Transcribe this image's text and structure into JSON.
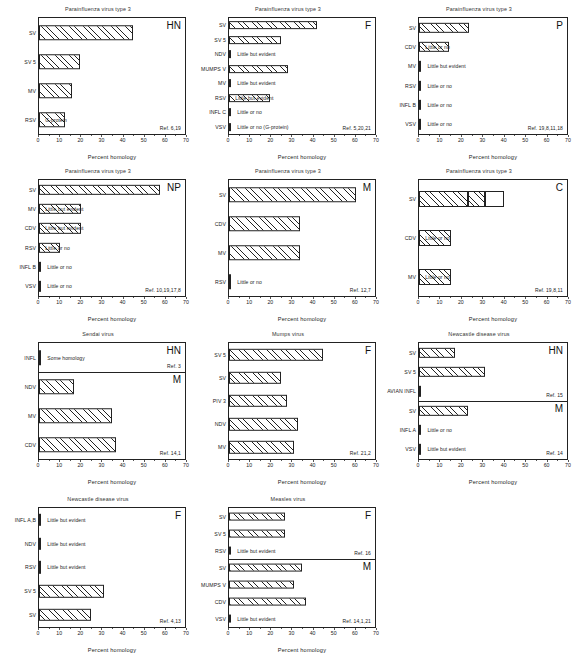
{
  "figure": {
    "axis": {
      "label": "Percent homology",
      "ticks": [
        0,
        10,
        20,
        30,
        40,
        50,
        60,
        70
      ],
      "min": 0,
      "max": 70
    },
    "notes": {
      "little_but_evident": "Little but evident",
      "little_or_no": "Little or no",
      "some_homology": "Some homology"
    }
  },
  "chart_data": [
    {
      "id": "piv3-hn",
      "type": "bar",
      "title": "Parainfluenza virus type 3",
      "gene": "HN",
      "ref": "Ref. 6,19",
      "xlabel": "Percent homology",
      "ylabel": "",
      "xlim": [
        0,
        70
      ],
      "categories": [
        "SV",
        "SV 5",
        "MV",
        "RSV"
      ],
      "values": [
        45,
        19.5,
        16,
        12.5
      ],
      "annotations": [
        "",
        "",
        "",
        "G-protein"
      ]
    },
    {
      "id": "piv3-f",
      "type": "bar",
      "title": "Parainfluenza virus type 3",
      "gene": "F",
      "ref": "Ref. 5,20,21",
      "xlabel": "Percent homology",
      "ylabel": "",
      "xlim": [
        0,
        70
      ],
      "categories": [
        "SV",
        "SV 5",
        "NDV",
        "MUMPS V",
        "MV",
        "RSV",
        "INFL C",
        "VSV"
      ],
      "values": [
        42,
        25,
        0,
        28.5,
        0,
        19.5,
        0,
        0
      ],
      "annotations": [
        "",
        "",
        "Little but evident",
        "",
        "Little but evident",
        "Little but evident",
        "Little or no",
        "Little or no  (G-protein)"
      ]
    },
    {
      "id": "piv3-p",
      "type": "bar",
      "title": "Parainfluenza virus type 3",
      "gene": "P",
      "ref": "Ref. 19,8,11,18",
      "xlabel": "Percent homology",
      "ylabel": "",
      "xlim": [
        0,
        70
      ],
      "categories": [
        "SV",
        "CDV",
        "MV",
        "RSV",
        "INFL B",
        "VSV"
      ],
      "values": [
        23.5,
        14,
        0,
        0,
        0,
        0
      ],
      "annotations": [
        "",
        "Little or no",
        "Little but evident",
        "Little or no",
        "Little or no",
        "Little or no"
      ]
    },
    {
      "id": "piv3-np",
      "type": "bar",
      "title": "Parainfluenza virus type 3",
      "gene": "NP",
      "ref": "Ref. 10,19,17,8",
      "xlabel": "Percent homology",
      "ylabel": "",
      "xlim": [
        0,
        70
      ],
      "categories": [
        "SV",
        "MV",
        "CDV",
        "RSV",
        "INFL B",
        "VSV"
      ],
      "values": [
        58,
        20,
        20,
        10,
        0,
        0
      ],
      "annotations": [
        "",
        "Little but evident",
        "Little but evident",
        "Little or no",
        "Little or no",
        "Little or no"
      ]
    },
    {
      "id": "piv3-m",
      "type": "bar",
      "title": "Parainfluenza virus type 3",
      "gene": "M",
      "ref": "Ref. 12,7",
      "xlabel": "Percent homology",
      "ylabel": "",
      "xlim": [
        0,
        70
      ],
      "categories": [
        "SV",
        "CDV",
        "MV",
        "RSV"
      ],
      "values": [
        61,
        34,
        34,
        0
      ],
      "annotations": [
        "",
        "",
        "",
        "Little or no"
      ]
    },
    {
      "id": "piv3-c",
      "type": "bar",
      "title": "Parainfluenza virus type 3",
      "gene": "C",
      "ref": "Ref. 19,8,11",
      "xlabel": "Percent homology",
      "ylabel": "",
      "xlim": [
        0,
        70
      ],
      "categories": [
        "SV",
        "CDV",
        "MV"
      ],
      "values": [
        31,
        15,
        15
      ],
      "segments": [
        [
          23,
          31,
          40
        ],
        [],
        []
      ],
      "annotations": [
        "",
        "Little or no",
        "Little or no"
      ]
    },
    {
      "id": "sendai",
      "type": "bar",
      "title": "Sendai virus",
      "split": true,
      "subpanels": [
        {
          "gene": "HN",
          "ref": "Ref. 3",
          "categories": [
            "INFL"
          ],
          "values": [
            0
          ],
          "annotations": [
            "Some homology"
          ]
        },
        {
          "gene": "M",
          "ref": "Ref. 14,1",
          "categories": [
            "NDV",
            "MV",
            "CDV"
          ],
          "values": [
            17,
            35,
            37
          ],
          "annotations": [
            "",
            "",
            ""
          ]
        }
      ],
      "xlabel": "Percent homology",
      "xlim": [
        0,
        70
      ]
    },
    {
      "id": "mumps-f",
      "type": "bar",
      "title": "Mumps virus",
      "gene": "F",
      "ref": "Ref. 21,2",
      "xlabel": "Percent homology",
      "ylabel": "",
      "xlim": [
        0,
        70
      ],
      "categories": [
        "SV 5",
        "SV",
        "PIV 3",
        "NDV",
        "MV"
      ],
      "values": [
        45,
        25,
        28,
        33,
        31
      ],
      "annotations": [
        "",
        "",
        "",
        "",
        ""
      ]
    },
    {
      "id": "ndv-hn-m",
      "type": "bar",
      "title": "Newcastle disease virus",
      "split": true,
      "subpanels": [
        {
          "gene": "HN",
          "ref": "Ref. 15",
          "categories": [
            "SV",
            "SV 5",
            "AVIAN INFL"
          ],
          "values": [
            17,
            31,
            0
          ],
          "annotations": [
            "",
            "",
            ""
          ]
        },
        {
          "gene": "M",
          "ref": "Ref. 14",
          "categories": [
            "SV",
            "INFL A",
            "VSV"
          ],
          "values": [
            23,
            0,
            0
          ],
          "annotations": [
            "",
            "Little or no",
            "Little but evident"
          ]
        }
      ],
      "xlabel": "Percent homology",
      "xlim": [
        0,
        70
      ]
    },
    {
      "id": "ndv-f",
      "type": "bar",
      "title": "Newcastle disease virus",
      "gene": "F",
      "ref": "Ref. 4,13",
      "xlabel": "Percent homology",
      "ylabel": "",
      "xlim": [
        0,
        70
      ],
      "categories": [
        "INFL A,B",
        "NDV",
        "RSV",
        "SV 5",
        "SV"
      ],
      "values": [
        0,
        0,
        0,
        31,
        25
      ],
      "annotations": [
        "Little but evident",
        "Little but evident",
        "Little but evident",
        "",
        ""
      ]
    },
    {
      "id": "measles",
      "type": "bar",
      "title": "Measles virus",
      "split": true,
      "subpanels": [
        {
          "gene": "F",
          "ref": "Ref. 16",
          "categories": [
            "SV",
            "SV 5",
            "RSV"
          ],
          "values": [
            27,
            27,
            0
          ],
          "annotations": [
            "",
            "",
            "Little but evident"
          ]
        },
        {
          "gene": "M",
          "ref": "Ref. 14,1,21",
          "categories": [
            "SV",
            "MUMPS V",
            "CDV",
            "VSV"
          ],
          "values": [
            35,
            31,
            37,
            0
          ],
          "annotations": [
            "",
            "",
            "",
            "Little but evident"
          ]
        }
      ],
      "xlabel": "Percent homology",
      "xlim": [
        0,
        70
      ]
    }
  ],
  "layout": {
    "columns": 3,
    "rows": 4,
    "panel_positions": [
      {
        "id": "piv3-hn",
        "x": 4,
        "y": 6,
        "w": 188,
        "h": 155
      },
      {
        "id": "piv3-f",
        "x": 194,
        "y": 6,
        "w": 188,
        "h": 155
      },
      {
        "id": "piv3-p",
        "x": 384,
        "y": 6,
        "w": 190,
        "h": 155
      },
      {
        "id": "piv3-np",
        "x": 4,
        "y": 168,
        "w": 188,
        "h": 155
      },
      {
        "id": "piv3-m",
        "x": 194,
        "y": 168,
        "w": 188,
        "h": 155
      },
      {
        "id": "piv3-c",
        "x": 384,
        "y": 168,
        "w": 190,
        "h": 155
      },
      {
        "id": "sendai",
        "x": 4,
        "y": 331,
        "w": 188,
        "h": 155
      },
      {
        "id": "mumps-f",
        "x": 194,
        "y": 331,
        "w": 188,
        "h": 155
      },
      {
        "id": "ndv-hn-m",
        "x": 384,
        "y": 331,
        "w": 190,
        "h": 155
      },
      {
        "id": "ndv-f",
        "x": 4,
        "y": 496,
        "w": 188,
        "h": 158
      },
      {
        "id": "measles",
        "x": 194,
        "y": 496,
        "w": 188,
        "h": 158
      }
    ]
  }
}
